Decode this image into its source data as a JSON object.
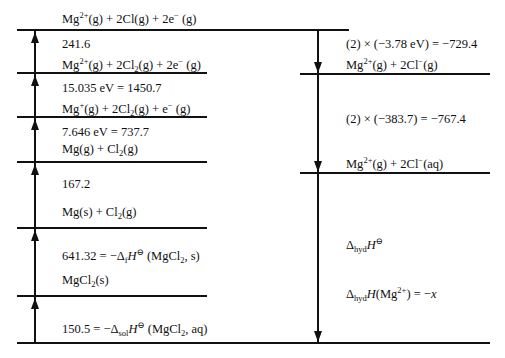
{
  "diagram": {
    "type": "Born-Haber cycle (energy level diagram)",
    "units": "kJ mol-1",
    "left_levels": [
      {
        "species": "Mg2+(g) + 2Cl(g) + 2e−(g)",
        "step_label": "241.6"
      },
      {
        "species": "Mg2+(g) + 2Cl2(g) + 2e− (g)",
        "step_label": "15.035 eV = 1450.7"
      },
      {
        "species": "Mg+(g) + 2Cl2(g) + e− (g)",
        "step_label": "7.646 eV = 737.7"
      },
      {
        "species": "Mg(g) + Cl2(g)",
        "step_label": "167.2"
      },
      {
        "species": "Mg(s) + Cl2(g)",
        "step_label": "641.32 = −ΔfH⊖ (MgCl2, s)"
      },
      {
        "species": "MgCl2(s)",
        "step_label": "150.5 = −ΔsolH⊖ (MgCl2, aq)"
      }
    ],
    "right_levels": [
      {
        "step_label": "(2) × (−3.78 eV) = −729.4",
        "species": "Mg2+(g) + 2Cl−(g)"
      },
      {
        "step_label": "(2) × (−383.7) = −767.4",
        "species": "Mg2+(g) + 2Cl−(aq)"
      },
      {
        "step_label_1": "ΔhydH⊖",
        "step_label_2": "ΔhydH(Mg2+) = −x"
      }
    ]
  },
  "labels": {
    "top_species": {
      "base": "Mg",
      "sup": "2+",
      "rest": "(g) + 2Cl(g) + 2e",
      "sup2": "−",
      "tail": " (g)"
    },
    "l1_value": "241.6",
    "l1_species": {
      "a": "Mg",
      "sup": "2+",
      "b": "(g) + 2Cl",
      "sub": "2",
      "c": "(g) + 2e",
      "sup2": "−",
      "d": " (g)"
    },
    "l2_value": "15.035 eV = 1450.7",
    "l2_species": {
      "a": "Mg",
      "sup": "+",
      "b": "(g) + 2Cl",
      "sub": "2",
      "c": "(g) + e",
      "sup2": "−",
      "d": " (g)"
    },
    "l3_value": "7.646 eV = 737.7",
    "l3_species": {
      "a": "Mg(g) + Cl",
      "sub": "2",
      "b": "(g)"
    },
    "l4_value": "167.2",
    "l4_species": {
      "a": "Mg(s) + Cl",
      "sub": "2",
      "b": "(g)"
    },
    "l5_value": {
      "a": "641.32 = −Δ",
      "sub": "f",
      "H": "H",
      "sup": "⊖",
      "b": " (MgCl",
      "sub2": "2",
      "c": ", s)"
    },
    "l5_species": {
      "a": "MgCl",
      "sub": "2",
      "b": "(s)"
    },
    "l6_value": {
      "a": "150.5 = −Δ",
      "sub": "sol",
      "H": "H",
      "sup": "⊖",
      "b": " (MgCl",
      "sub2": "2",
      "c": ", aq)"
    },
    "r1_value": "(2) × (−3.78 eV) = −729.4",
    "r1_species": {
      "a": "Mg",
      "sup": "2+",
      "b": "(g) + 2Cl",
      "sup2": "−",
      "c": "(g)"
    },
    "r2_value": "(2) × (−383.7) = −767.4",
    "r2_species": {
      "a": "Mg",
      "sup": "2+",
      "b": "(g) + 2Cl",
      "sup2": "−",
      "c": "(aq)"
    },
    "r3_value": {
      "a": "Δ",
      "sub": "hyd",
      "H": "H",
      "sup": "⊖"
    },
    "r4_value": {
      "a": "Δ",
      "sub": "hyd",
      "H": "H",
      "b": "(Mg",
      "sup": "2+",
      "c": ") = −",
      "x": "x"
    }
  }
}
